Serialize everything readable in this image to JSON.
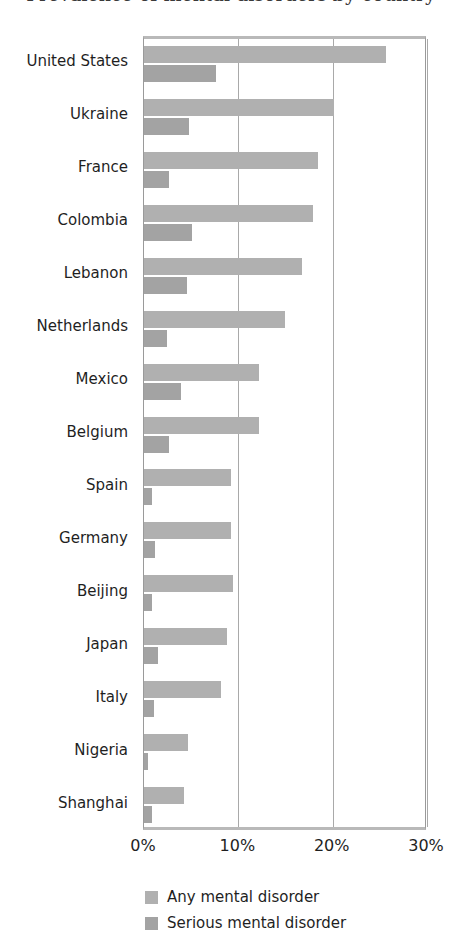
{
  "figure": {
    "title_partial": "Prevalence of mental disorders by country",
    "background_color": "#ffffff"
  },
  "chart_data": {
    "type": "bar",
    "orientation": "horizontal",
    "title": "",
    "xlabel": "",
    "ylabel": "",
    "xlim": [
      0,
      30
    ],
    "xticks": [
      "0%",
      "10%",
      "20%",
      "30%"
    ],
    "xtick_values": [
      0,
      10,
      20,
      30
    ],
    "grid": true,
    "grid_axis": "x",
    "legend_position": "below-axis-left",
    "categories": [
      "United States",
      "Ukraine",
      "France",
      "Colombia",
      "Lebanon",
      "Netherlands",
      "Mexico",
      "Belgium",
      "Spain",
      "Germany",
      "Beijing",
      "Japan",
      "Italy",
      "Nigeria",
      "Shanghai"
    ],
    "series": [
      {
        "name": "Any mental disorder",
        "color": "#b0b0b0",
        "values": [
          25.7,
          20.1,
          18.4,
          17.9,
          16.8,
          14.9,
          12.2,
          12.2,
          9.2,
          9.2,
          9.4,
          8.8,
          8.2,
          4.7,
          4.2
        ]
      },
      {
        "name": "Serious mental disorder",
        "color": "#a3a3a3",
        "values": [
          7.6,
          4.8,
          2.7,
          5.1,
          4.6,
          2.4,
          3.9,
          2.6,
          0.9,
          1.2,
          0.9,
          1.5,
          1.1,
          0.4,
          0.9
        ]
      }
    ]
  },
  "legend": {
    "items": [
      {
        "label": "Any mental disorder",
        "color": "#b0b0b0"
      },
      {
        "label": "Serious mental disorder",
        "color": "#a3a3a3"
      }
    ]
  }
}
